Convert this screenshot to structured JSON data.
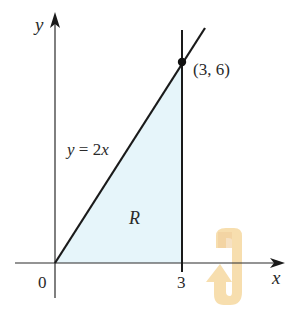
{
  "figure": {
    "axes": {
      "x_label": "x",
      "y_label": "y",
      "origin_label": "0",
      "x_tick_label": "3"
    },
    "curve": {
      "equation_label": "y = 2x",
      "equation_lhs": "y",
      "equation_eq": " = 2",
      "equation_rhs": "x"
    },
    "point": {
      "label": "(3, 6)",
      "x": 3,
      "y": 6
    },
    "region": {
      "label": "R",
      "fill_color": "#e6f5fa",
      "bounds": "y = 2x, x = 3, y = 0"
    },
    "rotation_indicator": {
      "icon": "rotation-arrow-icon",
      "about_axis": "x",
      "color": "#f5d79a"
    },
    "colors": {
      "line": "#1a1a1a",
      "text": "#2a2a2a",
      "background": "#ffffff"
    }
  }
}
